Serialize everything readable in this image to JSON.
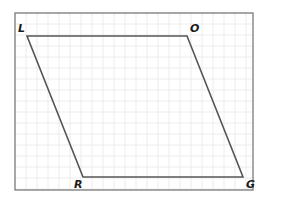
{
  "figure": {
    "type": "parallelogram-on-grid",
    "shape_name": "LORG",
    "frame": {
      "x": 15,
      "y": 13,
      "width": 238,
      "height": 177,
      "stroke": "#6e6e6e"
    },
    "grid": {
      "spacing": 11,
      "color": "#ececec"
    },
    "polygon": {
      "stroke": "#555555",
      "stroke_width": 1.6
    },
    "vertices": [
      {
        "id": "L",
        "label": "L",
        "x": 27,
        "y": 36,
        "label_x": 18,
        "label_y": 32
      },
      {
        "id": "O",
        "label": "O",
        "x": 187,
        "y": 36,
        "label_x": 190,
        "label_y": 32
      },
      {
        "id": "G",
        "label": "G",
        "x": 243,
        "y": 177,
        "label_x": 246,
        "label_y": 188
      },
      {
        "id": "R",
        "label": "R",
        "x": 83,
        "y": 177,
        "label_x": 74,
        "label_y": 188
      }
    ]
  }
}
